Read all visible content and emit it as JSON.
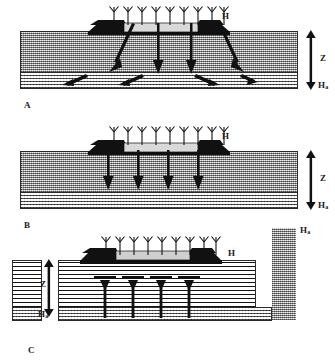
{
  "figure": {
    "panels": [
      {
        "id": "A",
        "label": "A",
        "surface_label": "H",
        "depth_label": "Z",
        "bottom_label": "H",
        "bottom_label_sub": "a",
        "soil_texture": "stipple",
        "bottom_layer_texture": "wavy",
        "flow": "vertical-and-diagonal-downward",
        "vertical_arrow_count": 2,
        "diagonal_arrow_count": 2,
        "lateral_arrow_count": 4,
        "rain_arrow_count": 9
      },
      {
        "id": "B",
        "label": "B",
        "surface_label": "H",
        "depth_label": "Z",
        "bottom_label": "H",
        "bottom_label_sub": "a",
        "soil_texture": "stipple",
        "bottom_layer_texture": "wavy",
        "flow": "vertical-downward",
        "vertical_arrow_count": 4,
        "rain_arrow_count": 9
      },
      {
        "id": "C",
        "label": "C",
        "surface_label": "H",
        "depth_label": "Z",
        "bottom_label": "H",
        "bottom_label_sub": "a",
        "column_label": "H",
        "column_label_sub": "a",
        "soil_texture": "horizontal-layers",
        "bottom_layer_texture": "wavy",
        "flow": "vertical-upward",
        "vertical_arrow_count": 4,
        "rain_arrow_count": 9
      }
    ],
    "legend_symbols": {
      "rain_symbol": "crop-sprout-arrow",
      "bed_symbol": "dark-raised-bed",
      "depth_arrow": "double-headed-vertical-arrow"
    },
    "colors": {
      "ink": "#111111",
      "bed_fill": "#3a3a3a",
      "soil_mid": "#b9b9b9",
      "soil_bottom": "#cfcfcf",
      "background": "#ffffff"
    }
  }
}
